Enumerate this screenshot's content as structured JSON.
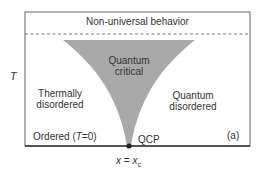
{
  "diagram": {
    "axis_label_y": "T",
    "regions": {
      "top_band": "Non-universal behavior",
      "critical_line1": "Quantum",
      "critical_line2": "critical",
      "left_line1": "Thermally",
      "left_line2": "disordered",
      "right_line1": "Quantum",
      "right_line2": "disordered"
    },
    "ordered_label_prefix": "Ordered (",
    "ordered_label_var": "T",
    "ordered_label_suffix": "=0)",
    "qcp_label": "QCP",
    "panel_label": "(a)",
    "x_axis_label_var": "x",
    "x_axis_label_eq": " = ",
    "x_axis_label_sub_base": "x",
    "x_axis_label_sub": "c",
    "colors": {
      "frame": "#555555",
      "axis": "#333333",
      "critical_fill": "#a9a9a9",
      "dashed_line": "#777777",
      "text": "#333333"
    }
  }
}
